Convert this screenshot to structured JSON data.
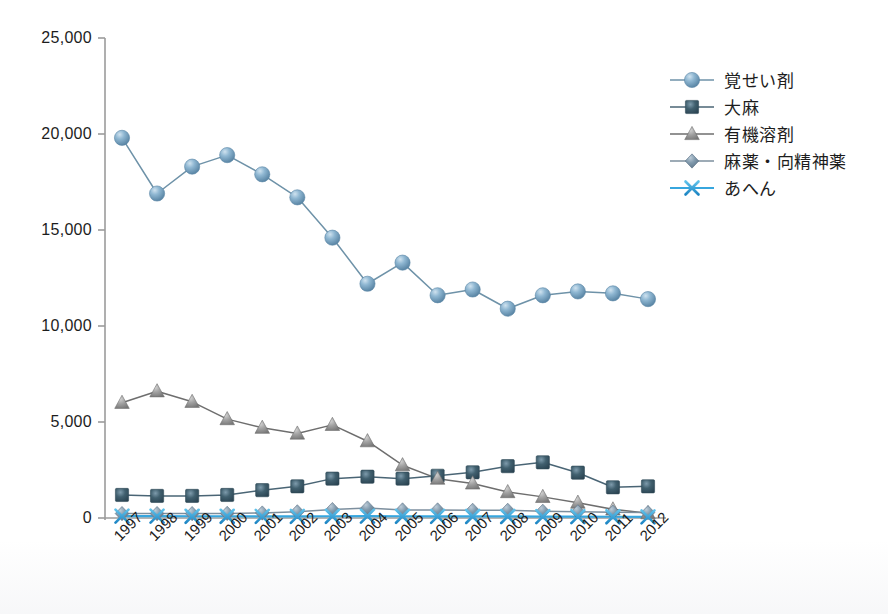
{
  "chart_data": {
    "type": "line",
    "title": "",
    "xlabel": "",
    "ylabel": "",
    "categories": [
      "1997",
      "1998",
      "1999",
      "2000",
      "2001",
      "2002",
      "2003",
      "2004",
      "2005",
      "2006",
      "2007",
      "2008",
      "2009",
      "2010",
      "2011",
      "2012"
    ],
    "ylim": [
      0,
      25000
    ],
    "ytick_values": [
      0,
      5000,
      10000,
      15000,
      20000,
      25000
    ],
    "ytick_labels": [
      "0",
      "5,000",
      "10,000",
      "15,000",
      "20,000",
      "25,000"
    ],
    "grid": false,
    "legend_position": "right",
    "series": [
      {
        "name": "覚せい剤",
        "marker": "circle",
        "color": "#6d9fc0",
        "line_color": "#6e92a8",
        "values": [
          19800,
          16900,
          18300,
          18900,
          17900,
          16700,
          14600,
          12200,
          13300,
          11600,
          11900,
          10900,
          11600,
          11800,
          11700,
          11400
        ]
      },
      {
        "name": "大麻",
        "marker": "square",
        "color": "#3d5a6c",
        "line_color": "#4a6575",
        "values": [
          1200,
          1150,
          1150,
          1200,
          1450,
          1650,
          2050,
          2150,
          2050,
          2200,
          2380,
          2700,
          2900,
          2360,
          1600,
          1650
        ]
      },
      {
        "name": "有機溶剤",
        "marker": "triangle",
        "color": "#9a9a9a",
        "line_color": "#6e6e6e",
        "values": [
          6000,
          6600,
          6050,
          5150,
          4700,
          4400,
          4850,
          4000,
          2750,
          2050,
          1800,
          1350,
          1100,
          800,
          450,
          250
        ]
      },
      {
        "name": "麻薬・向精神薬",
        "marker": "diamond",
        "color": "#7d94a8",
        "line_color": "#7d8f9e",
        "values": [
          230,
          230,
          230,
          240,
          260,
          320,
          440,
          520,
          420,
          420,
          400,
          400,
          350,
          320,
          300,
          280
        ]
      },
      {
        "name": "あへん",
        "marker": "x",
        "color": "#2e9bd6",
        "line_color": "#37a6de",
        "values": [
          100,
          95,
          90,
          90,
          85,
          85,
          90,
          95,
          90,
          85,
          80,
          80,
          75,
          70,
          65,
          60
        ]
      }
    ]
  },
  "axes": {
    "y_axis_name": "value-axis",
    "x_axis_name": "year-axis"
  }
}
